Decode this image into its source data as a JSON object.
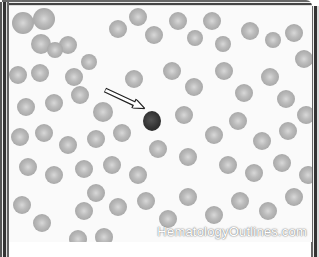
{
  "image": {
    "subject": "peripheral blood smear with red blood cells and one nucleated cell indicated by arrow",
    "watermark": "HematologyOutlines.com",
    "indicator": "arrow-pointing-to-nucleated-cell"
  },
  "colors": {
    "background": "#fafafa",
    "rbc": "#b0b0b0",
    "nucleated_cell": "#333333",
    "frame": "#444444"
  }
}
